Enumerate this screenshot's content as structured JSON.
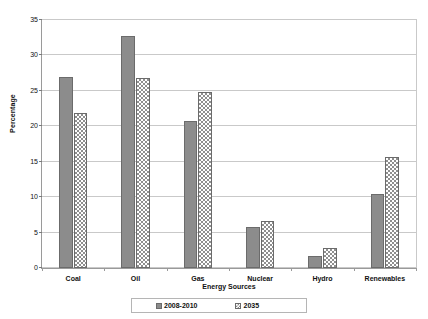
{
  "chart_data": {
    "type": "bar",
    "title": "",
    "subtitle": "",
    "xlabel": "Energy Sources",
    "ylabel": "Percentage",
    "categories": [
      "Coal",
      "Oil",
      "Gas",
      "Nuclear",
      "Hydro",
      "Renewables"
    ],
    "series": [
      {
        "name": "2008-2010",
        "values": [
          26.9,
          32.8,
          20.8,
          5.8,
          1.7,
          10.5
        ],
        "color": "#8c8c8c",
        "pattern": "solid"
      },
      {
        "name": "2035",
        "values": [
          21.9,
          26.8,
          24.8,
          6.6,
          2.8,
          15.6
        ],
        "color": "#8f8f8f",
        "pattern": "checkered"
      }
    ],
    "ylim": [
      0,
      35
    ],
    "ytick_step": 5,
    "ytick_labels": [
      "0",
      "5",
      "10",
      "15",
      "20",
      "25",
      "30",
      "35"
    ],
    "grid": "horizontal",
    "legend_position": "bottom",
    "legend_entries": [
      "2008-2010",
      "2035"
    ]
  }
}
